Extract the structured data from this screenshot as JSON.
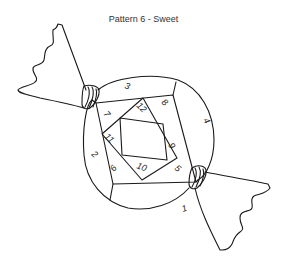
{
  "title": "Pattern 6 - Sweet",
  "pieces": [
    {
      "label": "1",
      "x": 183,
      "y": 212,
      "rot": -20
    },
    {
      "label": "2",
      "x": 93,
      "y": 155,
      "rot": 40
    },
    {
      "label": "3",
      "x": 126,
      "y": 90,
      "rot": 20
    },
    {
      "label": "4",
      "x": 204,
      "y": 122,
      "rot": 60
    },
    {
      "label": "5",
      "x": 176,
      "y": 171,
      "rot": 40
    },
    {
      "label": "6",
      "x": 115,
      "y": 170,
      "rot": -50
    },
    {
      "label": "7",
      "x": 105,
      "y": 115,
      "rot": 50
    },
    {
      "label": "8",
      "x": 163,
      "y": 104,
      "rot": 40
    },
    {
      "label": "9",
      "x": 169,
      "y": 147,
      "rot": 60
    },
    {
      "label": "10",
      "x": 139,
      "y": 170,
      "rot": 20
    },
    {
      "label": "11",
      "x": 106,
      "y": 138,
      "rot": 45
    },
    {
      "label": "12",
      "x": 137,
      "y": 108,
      "rot": 45
    }
  ]
}
